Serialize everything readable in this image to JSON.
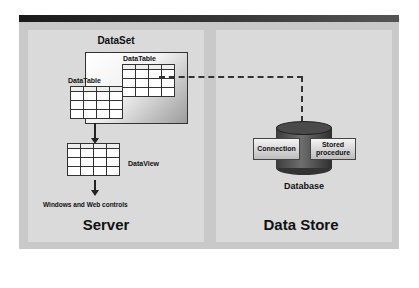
{
  "diagram": {
    "server": {
      "title": "Server",
      "dataset": {
        "label": "DataSet",
        "tables": [
          {
            "label": "DataTable"
          },
          {
            "label": "DataTable"
          }
        ]
      },
      "dataview": {
        "label": "DataView"
      },
      "controls": {
        "label": "Windows and Web controls"
      }
    },
    "data_store": {
      "title": "Data Store",
      "database": {
        "label": "Database",
        "components": [
          {
            "label": "Connection"
          },
          {
            "label": "Stored procedure"
          }
        ]
      }
    },
    "connections": [
      {
        "from": "DataSet",
        "to": "Database",
        "style": "dashed"
      },
      {
        "from": "DataSet",
        "to": "DataView",
        "style": "arrow"
      },
      {
        "from": "DataView",
        "to": "Windows and Web controls",
        "style": "arrow"
      }
    ],
    "colors": {
      "header_bar": "#2a2a2a",
      "frame": "#c9c9c9",
      "panel": "#dcdcdc",
      "cylinder": "#4a4a4a"
    }
  }
}
